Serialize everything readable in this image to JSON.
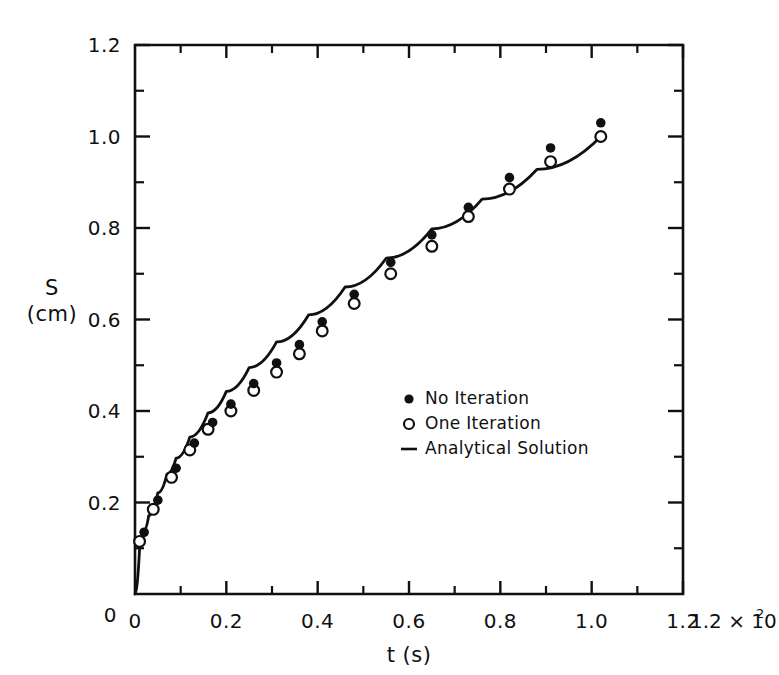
{
  "chart_data": {
    "type": "scatter",
    "title": "",
    "subtitle": "",
    "xlabel": "t (s)",
    "ylabel": "S (cm)",
    "ylabel_symbol": "S",
    "ylabel_unit": "(cm)",
    "xlabel_symbol": "t",
    "xlabel_unit": "(s)",
    "x_exponent_base": "1.2 × 10",
    "x_exponent_power": "2",
    "x_axis_multiplier": "×10²",
    "xlim": [
      0,
      120
    ],
    "ylim": [
      0,
      1.2
    ],
    "x_tick_labels": [
      "0",
      "0.2",
      "0.4",
      "0.6",
      "0.8",
      "1.0",
      "1.2"
    ],
    "x_tick_values": [
      0,
      20,
      40,
      60,
      80,
      100,
      120
    ],
    "x_minor_tick_values": [
      10,
      30,
      50,
      70,
      90,
      110
    ],
    "y_tick_labels": [
      "0",
      "0.2",
      "0.4",
      "0.6",
      "0.8",
      "1.0",
      "1.2"
    ],
    "y_tick_values": [
      0,
      0.2,
      0.4,
      0.6,
      0.8,
      1.0,
      1.2
    ],
    "y_minor_tick_values": [
      0.1,
      0.3,
      0.5,
      0.7,
      0.9,
      1.1
    ],
    "grid": false,
    "legend_position": "center-right",
    "series": [
      {
        "name": "No Iteration",
        "marker": "filled-circle",
        "x": [
          2,
          5,
          9,
          13,
          17,
          21,
          26,
          31,
          36,
          41,
          48,
          56,
          65,
          73,
          82,
          91,
          102
        ],
        "y": [
          0.135,
          0.205,
          0.275,
          0.33,
          0.375,
          0.415,
          0.46,
          0.505,
          0.545,
          0.595,
          0.655,
          0.725,
          0.785,
          0.845,
          0.91,
          0.975,
          1.03
        ]
      },
      {
        "name": "One Iteration",
        "marker": "open-circle",
        "x": [
          1,
          4,
          8,
          12,
          16,
          21,
          26,
          31,
          36,
          41,
          48,
          56,
          65,
          73,
          82,
          91,
          102
        ],
        "y": [
          0.115,
          0.185,
          0.255,
          0.315,
          0.36,
          0.4,
          0.445,
          0.485,
          0.525,
          0.575,
          0.635,
          0.7,
          0.76,
          0.825,
          0.885,
          0.945,
          1.0
        ]
      },
      {
        "name": "Analytical Solution",
        "marker": "line",
        "x": [
          0,
          1,
          2,
          3,
          5,
          7,
          9,
          12,
          16,
          20,
          25,
          31,
          38,
          46,
          55,
          65,
          76,
          88,
          102
        ],
        "y": [
          0,
          0.099,
          0.14,
          0.171,
          0.221,
          0.262,
          0.297,
          0.343,
          0.396,
          0.443,
          0.495,
          0.551,
          0.61,
          0.671,
          0.734,
          0.798,
          0.863,
          0.928,
          1.0
        ]
      }
    ],
    "legend_entries": [
      {
        "label": "No Iteration",
        "marker": "filled-circle"
      },
      {
        "label": "One Iteration",
        "marker": "open-circle"
      },
      {
        "label": "Analytical Solution",
        "marker": "line"
      }
    ],
    "colors": {
      "ink": "#101010",
      "background": "#ffffff"
    }
  }
}
